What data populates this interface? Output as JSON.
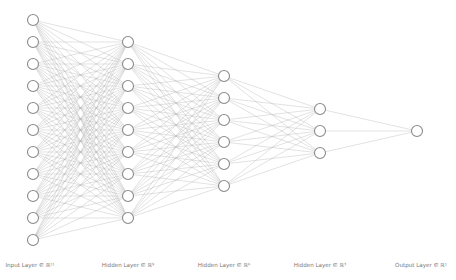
{
  "diagram": {
    "type": "neural-network-architecture",
    "colors": {
      "background": "#ffffff",
      "node_stroke": "#8a8a8a",
      "node_fill": "#ffffff",
      "edge": "#b4b4b4",
      "label": "#777777"
    },
    "layers": [
      {
        "name": "input",
        "label": "Input Layer ∈ ℝ¹¹",
        "size": 11,
        "x": 33,
        "y_start": 20,
        "label_x": 30
      },
      {
        "name": "hidden-1",
        "label": "Hidden Layer ∈ ℝ⁹",
        "size": 9,
        "x": 128,
        "y_start": 42,
        "label_x": 128
      },
      {
        "name": "hidden-2",
        "label": "Hidden Layer ∈ ℝ⁶",
        "size": 6,
        "x": 224,
        "y_start": 76,
        "label_x": 224
      },
      {
        "name": "hidden-3",
        "label": "Hidden Layer ∈ ℝ³",
        "size": 3,
        "x": 320,
        "y_start": 109,
        "label_x": 320
      },
      {
        "name": "output",
        "label": "Output Layer ∈ ℝ¹",
        "size": 1,
        "x": 417,
        "y_start": 131,
        "label_x": 421
      }
    ],
    "node_spacing": 22,
    "node_radius": 5.5,
    "fully_connected": true
  }
}
